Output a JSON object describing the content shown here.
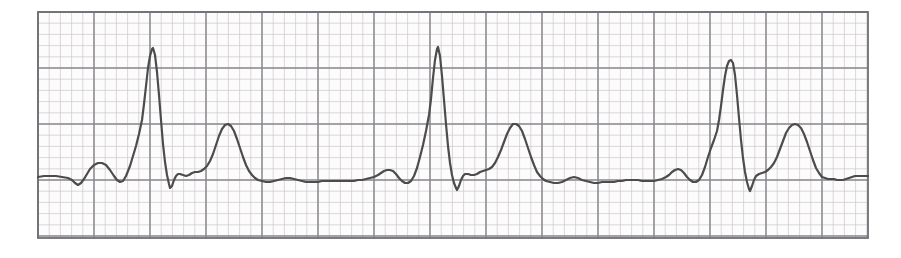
{
  "document": {
    "kind": "ecg-rhythm-strip",
    "title": "ECG rhythm strip",
    "description": "Single-lead electrocardiogram tracing on standard pink graph paper showing three sinus beats with tall R waves and broad upright T waves",
    "lead_label": "",
    "annotations": []
  },
  "canvas": {
    "width": 901,
    "height": 258,
    "background_color": "#ffffff"
  },
  "grid": {
    "x0": 38,
    "y0": 12,
    "x1": 868,
    "y1": 238,
    "major_spacing": 56.0,
    "minor_spacing": 11.2,
    "major_color": "#8a8a90",
    "minor_color": "#cfc6c9",
    "border_color": "#6e6e74",
    "paper_color": "#fdfcfc",
    "major_cols": 15,
    "major_rows": 4,
    "speed_label": "",
    "gain_label": ""
  },
  "trace": {
    "color": "#4c4c4c",
    "width": 2.2,
    "baseline_y": 180,
    "label": "lead-II"
  },
  "chart_data": {
    "type": "line",
    "xlabel": "",
    "ylabel": "",
    "grid": true,
    "legend": "none",
    "xlim": [
      38,
      868
    ],
    "ylim": [
      238,
      12
    ],
    "baseline": 180,
    "series": [
      {
        "name": "ecg-waveform",
        "points": [
          [
            38,
            177
          ],
          [
            44,
            176
          ],
          [
            50,
            176
          ],
          [
            56,
            176
          ],
          [
            62,
            177
          ],
          [
            68,
            178
          ],
          [
            72,
            180
          ],
          [
            75,
            183
          ],
          [
            78,
            185
          ],
          [
            81,
            183
          ],
          [
            84,
            179
          ],
          [
            87,
            174
          ],
          [
            90,
            169
          ],
          [
            94,
            165
          ],
          [
            98,
            163
          ],
          [
            102,
            163
          ],
          [
            106,
            165
          ],
          [
            110,
            170
          ],
          [
            114,
            176
          ],
          [
            117,
            180
          ],
          [
            120,
            182
          ],
          [
            123,
            181
          ],
          [
            126,
            176
          ],
          [
            130,
            166
          ],
          [
            133,
            156
          ],
          [
            136,
            146
          ],
          [
            139,
            134
          ],
          [
            142,
            120
          ],
          [
            144,
            104
          ],
          [
            146,
            86
          ],
          [
            148,
            68
          ],
          [
            150,
            56
          ],
          [
            152,
            49
          ],
          [
            153,
            48
          ],
          [
            155,
            55
          ],
          [
            157,
            72
          ],
          [
            159,
            95
          ],
          [
            161,
            120
          ],
          [
            163,
            144
          ],
          [
            165,
            162
          ],
          [
            167,
            175
          ],
          [
            169,
            184
          ],
          [
            170,
            188
          ],
          [
            172,
            186
          ],
          [
            174,
            180
          ],
          [
            176,
            176
          ],
          [
            178,
            174
          ],
          [
            180,
            174
          ],
          [
            183,
            175
          ],
          [
            186,
            176
          ],
          [
            189,
            175
          ],
          [
            192,
            173
          ],
          [
            195,
            172
          ],
          [
            198,
            172
          ],
          [
            201,
            171
          ],
          [
            204,
            169
          ],
          [
            207,
            166
          ],
          [
            210,
            161
          ],
          [
            213,
            154
          ],
          [
            216,
            145
          ],
          [
            219,
            136
          ],
          [
            222,
            129
          ],
          [
            225,
            125
          ],
          [
            228,
            124
          ],
          [
            231,
            126
          ],
          [
            234,
            131
          ],
          [
            237,
            139
          ],
          [
            240,
            148
          ],
          [
            243,
            157
          ],
          [
            246,
            165
          ],
          [
            249,
            171
          ],
          [
            252,
            175
          ],
          [
            255,
            178
          ],
          [
            258,
            180
          ],
          [
            262,
            181
          ],
          [
            266,
            182
          ],
          [
            270,
            182
          ],
          [
            274,
            181
          ],
          [
            278,
            180
          ],
          [
            282,
            179
          ],
          [
            286,
            178
          ],
          [
            290,
            178
          ],
          [
            294,
            179
          ],
          [
            298,
            180
          ],
          [
            302,
            181
          ],
          [
            306,
            182
          ],
          [
            310,
            182
          ],
          [
            314,
            182
          ],
          [
            318,
            182
          ],
          [
            322,
            181
          ],
          [
            326,
            181
          ],
          [
            330,
            181
          ],
          [
            334,
            181
          ],
          [
            338,
            181
          ],
          [
            342,
            181
          ],
          [
            346,
            181
          ],
          [
            350,
            181
          ],
          [
            354,
            181
          ],
          [
            358,
            180
          ],
          [
            362,
            180
          ],
          [
            366,
            179
          ],
          [
            370,
            178
          ],
          [
            374,
            177
          ],
          [
            378,
            175
          ],
          [
            381,
            173
          ],
          [
            384,
            171
          ],
          [
            387,
            170
          ],
          [
            390,
            170
          ],
          [
            393,
            171
          ],
          [
            396,
            174
          ],
          [
            399,
            178
          ],
          [
            402,
            181
          ],
          [
            405,
            183
          ],
          [
            408,
            183
          ],
          [
            411,
            181
          ],
          [
            414,
            176
          ],
          [
            417,
            168
          ],
          [
            420,
            157
          ],
          [
            423,
            145
          ],
          [
            426,
            131
          ],
          [
            429,
            115
          ],
          [
            431,
            99
          ],
          [
            433,
            78
          ],
          [
            435,
            60
          ],
          [
            437,
            49
          ],
          [
            438,
            47
          ],
          [
            440,
            56
          ],
          [
            442,
            76
          ],
          [
            444,
            100
          ],
          [
            446,
            124
          ],
          [
            448,
            146
          ],
          [
            450,
            163
          ],
          [
            452,
            175
          ],
          [
            454,
            183
          ],
          [
            456,
            188
          ],
          [
            457,
            190
          ],
          [
            459,
            186
          ],
          [
            461,
            180
          ],
          [
            463,
            176
          ],
          [
            465,
            174
          ],
          [
            468,
            174
          ],
          [
            471,
            175
          ],
          [
            474,
            175
          ],
          [
            477,
            174
          ],
          [
            480,
            172
          ],
          [
            483,
            171
          ],
          [
            486,
            170
          ],
          [
            489,
            169
          ],
          [
            492,
            167
          ],
          [
            495,
            163
          ],
          [
            498,
            157
          ],
          [
            501,
            150
          ],
          [
            504,
            142
          ],
          [
            507,
            134
          ],
          [
            510,
            128
          ],
          [
            513,
            124
          ],
          [
            516,
            124
          ],
          [
            519,
            126
          ],
          [
            522,
            131
          ],
          [
            525,
            139
          ],
          [
            528,
            148
          ],
          [
            531,
            157
          ],
          [
            534,
            165
          ],
          [
            537,
            172
          ],
          [
            540,
            176
          ],
          [
            543,
            179
          ],
          [
            546,
            181
          ],
          [
            550,
            182
          ],
          [
            554,
            183
          ],
          [
            558,
            183
          ],
          [
            562,
            182
          ],
          [
            566,
            180
          ],
          [
            570,
            178
          ],
          [
            574,
            177
          ],
          [
            578,
            178
          ],
          [
            582,
            180
          ],
          [
            586,
            181
          ],
          [
            590,
            182
          ],
          [
            594,
            183
          ],
          [
            598,
            183
          ],
          [
            602,
            182
          ],
          [
            606,
            182
          ],
          [
            610,
            182
          ],
          [
            614,
            182
          ],
          [
            618,
            181
          ],
          [
            622,
            181
          ],
          [
            626,
            180
          ],
          [
            630,
            180
          ],
          [
            634,
            180
          ],
          [
            638,
            180
          ],
          [
            642,
            181
          ],
          [
            646,
            181
          ],
          [
            650,
            181
          ],
          [
            654,
            181
          ],
          [
            658,
            180
          ],
          [
            662,
            179
          ],
          [
            666,
            177
          ],
          [
            669,
            175
          ],
          [
            672,
            172
          ],
          [
            675,
            170
          ],
          [
            678,
            169
          ],
          [
            681,
            170
          ],
          [
            684,
            173
          ],
          [
            687,
            177
          ],
          [
            690,
            180
          ],
          [
            693,
            182
          ],
          [
            696,
            182
          ],
          [
            699,
            180
          ],
          [
            702,
            175
          ],
          [
            705,
            167
          ],
          [
            708,
            157
          ],
          [
            711,
            148
          ],
          [
            714,
            140
          ],
          [
            717,
            131
          ],
          [
            719,
            120
          ],
          [
            721,
            106
          ],
          [
            723,
            90
          ],
          [
            725,
            76
          ],
          [
            727,
            66
          ],
          [
            729,
            61
          ],
          [
            731,
            60
          ],
          [
            733,
            63
          ],
          [
            735,
            75
          ],
          [
            737,
            95
          ],
          [
            739,
            118
          ],
          [
            741,
            140
          ],
          [
            743,
            158
          ],
          [
            745,
            172
          ],
          [
            747,
            182
          ],
          [
            749,
            189
          ],
          [
            750,
            191
          ],
          [
            752,
            186
          ],
          [
            754,
            180
          ],
          [
            756,
            176
          ],
          [
            759,
            174
          ],
          [
            762,
            173
          ],
          [
            765,
            172
          ],
          [
            768,
            170
          ],
          [
            771,
            167
          ],
          [
            774,
            163
          ],
          [
            777,
            157
          ],
          [
            780,
            149
          ],
          [
            783,
            141
          ],
          [
            786,
            133
          ],
          [
            789,
            128
          ],
          [
            792,
            125
          ],
          [
            795,
            124
          ],
          [
            798,
            125
          ],
          [
            801,
            128
          ],
          [
            804,
            134
          ],
          [
            807,
            142
          ],
          [
            810,
            151
          ],
          [
            813,
            160
          ],
          [
            816,
            168
          ],
          [
            819,
            173
          ],
          [
            822,
            177
          ],
          [
            825,
            178
          ],
          [
            828,
            179
          ],
          [
            831,
            179
          ],
          [
            834,
            179
          ],
          [
            837,
            180
          ],
          [
            840,
            180
          ],
          [
            843,
            180
          ],
          [
            846,
            179
          ],
          [
            849,
            178
          ],
          [
            852,
            177
          ],
          [
            855,
            176
          ],
          [
            858,
            176
          ],
          [
            861,
            176
          ],
          [
            864,
            176
          ],
          [
            868,
            176
          ]
        ]
      }
    ],
    "features": [
      {
        "name": "R-wave-1",
        "x": 152,
        "y": 48,
        "label": "R"
      },
      {
        "name": "T-wave-1",
        "x": 228,
        "y": 124,
        "label": "T"
      },
      {
        "name": "P-wave-1",
        "x": 101,
        "y": 163,
        "label": "P"
      },
      {
        "name": "R-wave-2",
        "x": 437,
        "y": 47,
        "label": "R"
      },
      {
        "name": "T-wave-2",
        "x": 516,
        "y": 124,
        "label": "T"
      },
      {
        "name": "P-wave-2",
        "x": 386,
        "y": 170,
        "label": "P"
      },
      {
        "name": "R-wave-3",
        "x": 731,
        "y": 60,
        "label": "R"
      },
      {
        "name": "T-wave-3",
        "x": 795,
        "y": 124,
        "label": "T"
      },
      {
        "name": "P-wave-3",
        "x": 679,
        "y": 169,
        "label": "P"
      }
    ]
  }
}
